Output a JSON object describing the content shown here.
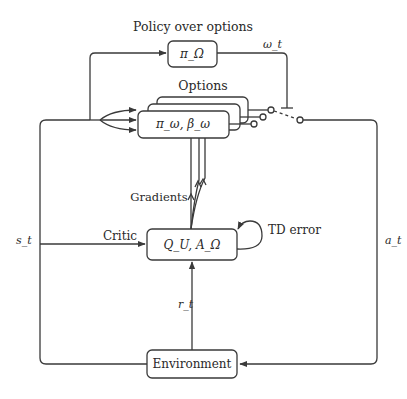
{
  "nodes": {
    "policy_over_options": {
      "caption": "Policy over options",
      "label": "π_Ω"
    },
    "options": {
      "caption": "Options",
      "label": "π_ω,  β_ω",
      "stack_count": 3
    },
    "critic": {
      "label": "Q_U, A_Ω"
    },
    "environment": {
      "label": "Environment"
    }
  },
  "edge_labels": {
    "option_selected": "ω_t",
    "state": "s_t",
    "action": "a_t",
    "reward": "r_t",
    "critic": "Critic",
    "gradients": "Gradients",
    "td_error": "TD error"
  },
  "colors": {
    "line": "#3a3a3a",
    "text": "#2a2a2a",
    "background": "#ffffff"
  }
}
